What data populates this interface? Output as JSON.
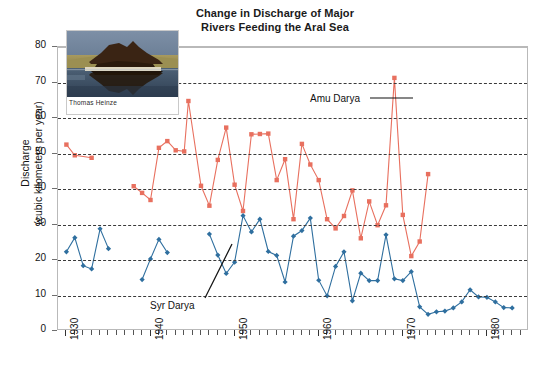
{
  "title": {
    "line1": "Change in Discharge of Major",
    "line2": "Rivers Feeding the Aral Sea"
  },
  "axes": {
    "y_title_line1": "Discharge",
    "y_title_line2": "(cubic kilometers per year)",
    "y_ticks": [
      "0",
      "10",
      "20",
      "30",
      "40",
      "50",
      "60",
      "70",
      "80"
    ],
    "x_ticks": [
      "1930",
      "1940",
      "1950",
      "1960",
      "1970",
      "1980"
    ]
  },
  "annotations": {
    "amu_label": "Amu Darya",
    "syr_label": "Syr Darya"
  },
  "photo": {
    "credit": "Thomas Heinze",
    "alt": "stranded-boat-on-dry-aral-seabed"
  },
  "colors": {
    "amu": "#e8705f",
    "syr": "#2f6f9f",
    "grid": "#3a3a3a",
    "frame": "#b9b9b9"
  },
  "chart_data": {
    "type": "line",
    "title": "Change in Discharge of Major Rivers Feeding the Aral Sea",
    "xlabel": "",
    "ylabel": "Discharge (cubic kilometers per year)",
    "xlim": [
      1929,
      1985
    ],
    "ylim": [
      0,
      80
    ],
    "ytick_step": 10,
    "grid": true,
    "legend": "inline-annotations",
    "series": [
      {
        "name": "Amu Darya",
        "color": "#e8705f",
        "marker": "square",
        "points": [
          [
            1930,
            52.5
          ],
          [
            1931,
            49.5
          ],
          [
            1933,
            48.8
          ],
          [
            1938,
            40.8
          ],
          [
            1939,
            38.9
          ],
          [
            1940,
            36.9
          ],
          [
            1941,
            51.6
          ],
          [
            1942,
            53.5
          ],
          [
            1943,
            50.9
          ],
          [
            1944,
            50.6
          ],
          [
            1944.5,
            64.8
          ],
          [
            1946,
            40.9
          ],
          [
            1947,
            35.3
          ],
          [
            1948,
            48.2
          ],
          [
            1949,
            57.3
          ],
          [
            1950,
            41.2
          ],
          [
            1951,
            33.8
          ],
          [
            1952,
            55.4
          ],
          [
            1953,
            55.5
          ],
          [
            1954,
            55.6
          ],
          [
            1955,
            42.5
          ],
          [
            1956,
            48.4
          ],
          [
            1957,
            31.5
          ],
          [
            1958,
            52.7
          ],
          [
            1959,
            46.9
          ],
          [
            1960,
            42.5
          ],
          [
            1961,
            31.5
          ],
          [
            1962,
            28.9
          ],
          [
            1963,
            32.4
          ],
          [
            1964,
            39.6
          ],
          [
            1965,
            26.1
          ],
          [
            1966,
            36.5
          ],
          [
            1967,
            29.8
          ],
          [
            1968,
            35.4
          ],
          [
            1969,
            71.3
          ],
          [
            1970,
            32.7
          ],
          [
            1971,
            21.1
          ],
          [
            1972,
            25.2
          ],
          [
            1973,
            44.2
          ]
        ]
      },
      {
        "name": "Syr Darya",
        "color": "#2f6f9f",
        "marker": "diamond",
        "points": [
          [
            1930,
            22.3
          ],
          [
            1931,
            26.3
          ],
          [
            1932,
            18.4
          ],
          [
            1933,
            17.5
          ],
          [
            1934,
            28.8
          ],
          [
            1935,
            23.2
          ],
          [
            1939,
            14.5
          ],
          [
            1940,
            20.3
          ],
          [
            1941,
            25.8
          ],
          [
            1942,
            22.1
          ],
          [
            1947,
            27.3
          ],
          [
            1948,
            21.4
          ],
          [
            1949,
            16.2
          ],
          [
            1950,
            19.4
          ],
          [
            1951,
            32.5
          ],
          [
            1952,
            27.9
          ],
          [
            1953,
            31.5
          ],
          [
            1954,
            22.4
          ],
          [
            1955,
            21.3
          ],
          [
            1956,
            13.8
          ],
          [
            1957,
            26.7
          ],
          [
            1958,
            28.3
          ],
          [
            1959,
            31.8
          ],
          [
            1960,
            14.3
          ],
          [
            1961,
            9.9
          ],
          [
            1962,
            18.2
          ],
          [
            1963,
            22.3
          ],
          [
            1964,
            8.5
          ],
          [
            1965,
            16.3
          ],
          [
            1966,
            14.2
          ],
          [
            1967,
            14.2
          ],
          [
            1968,
            27.1
          ],
          [
            1969,
            14.7
          ],
          [
            1970,
            14.2
          ],
          [
            1971,
            16.7
          ],
          [
            1972,
            6.8
          ],
          [
            1973,
            4.7
          ],
          [
            1974,
            5.4
          ],
          [
            1975,
            5.6
          ],
          [
            1976,
            6.5
          ],
          [
            1977,
            8.2
          ],
          [
            1978,
            11.6
          ],
          [
            1979,
            9.6
          ],
          [
            1980,
            9.5
          ],
          [
            1981,
            8.2
          ],
          [
            1982,
            6.6
          ],
          [
            1983,
            6.5
          ]
        ]
      }
    ]
  }
}
